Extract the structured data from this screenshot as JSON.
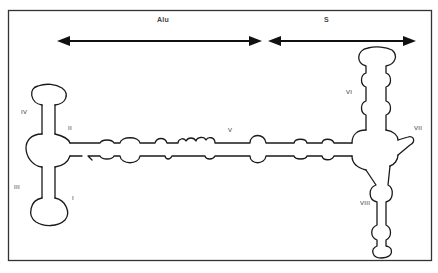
{
  "diagram": {
    "type": "RNA secondary structure schematic",
    "regions": [
      {
        "label": "Alu",
        "span_arrow": "double-headed"
      },
      {
        "label": "S",
        "span_arrow": "double-headed"
      }
    ],
    "helices": [
      "I",
      "II",
      "III",
      "IV",
      "V",
      "VI",
      "VII",
      "VIII"
    ],
    "colors": {
      "stroke": "#1a1a1a",
      "background": "#ffffff",
      "frame": "#333333"
    }
  },
  "labels": {
    "alu": "Alu",
    "s": "S",
    "h1": "I",
    "h2": "II",
    "h3": "III",
    "h4": "IV",
    "h5": "V",
    "h6": "VI",
    "h7": "VII",
    "h8": "VIII"
  }
}
